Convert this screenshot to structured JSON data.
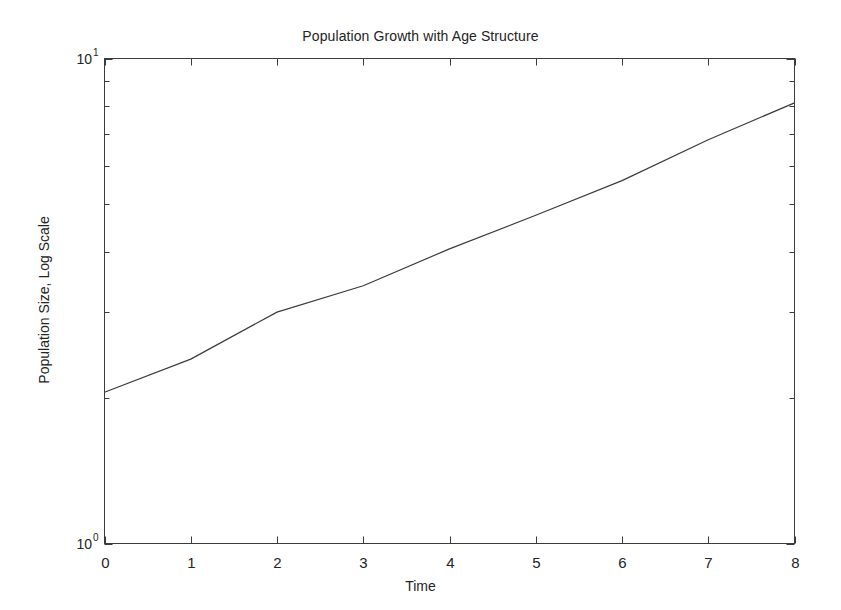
{
  "chart_data": {
    "type": "line",
    "title": "Population Growth with Age Structure",
    "xlabel": "Time",
    "ylabel": "Population Size, Log Scale",
    "yscale": "log",
    "xlim": [
      0,
      8
    ],
    "ylim": [
      1,
      10
    ],
    "grid": false,
    "legend": null,
    "x": [
      0,
      1,
      2,
      3,
      4,
      5,
      6,
      7,
      8
    ],
    "values": [
      2.05,
      2.4,
      3.0,
      3.4,
      4.05,
      4.75,
      5.6,
      6.8,
      8.1
    ],
    "series": [
      {
        "name": "Population Size",
        "color": "#3c3c3c",
        "values": [
          2.05,
          2.4,
          3.0,
          3.4,
          4.05,
          4.75,
          5.6,
          6.8,
          8.1
        ]
      }
    ],
    "xticks": [
      "0",
      "1",
      "2",
      "3",
      "4",
      "5",
      "6",
      "7",
      "8"
    ],
    "ytick_labels": [
      "10^0",
      "10^1"
    ],
    "ytick_mantissa": "10",
    "ytick_exponents": [
      "1",
      "0"
    ],
    "yminor_ticks": [
      2,
      3,
      4,
      5,
      6,
      7,
      8,
      9
    ],
    "axis_color": "#3c3c3c",
    "background": "#ffffff"
  }
}
